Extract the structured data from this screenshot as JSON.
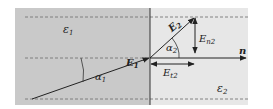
{
  "diagram": {
    "regions": {
      "left": {
        "label": "ε",
        "sub": "1",
        "color": "#c9c9c9"
      },
      "right": {
        "label": "ε",
        "sub": "2",
        "color": "#e7e7e7"
      }
    },
    "vectors": {
      "e1": {
        "label": "E",
        "sub": "1"
      },
      "e2": {
        "label": "E",
        "sub": "2"
      },
      "en2": {
        "label": "E",
        "sub": "n2"
      },
      "et2": {
        "label": "E",
        "sub": "t2"
      },
      "normal": {
        "label": "n"
      }
    },
    "angles": {
      "alpha1": {
        "label": "α",
        "sub": "1"
      },
      "alpha2": {
        "label": "α",
        "sub": "2"
      }
    },
    "colors": {
      "line": "#2a2a2a",
      "dash": "#777777",
      "boundary": "#333333"
    }
  }
}
